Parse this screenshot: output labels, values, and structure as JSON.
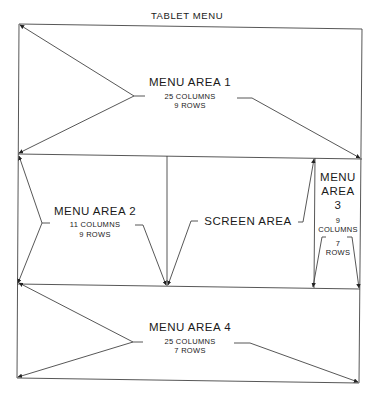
{
  "title": "TABLET MENU",
  "areas": {
    "menu1": {
      "name": "MENU AREA 1",
      "columns": "25 COLUMNS",
      "rows": "9 ROWS"
    },
    "menu2": {
      "name": "MENU AREA 2",
      "columns": "11 COLUMNS",
      "rows": "9 ROWS"
    },
    "screen": {
      "name": "SCREEN AREA"
    },
    "menu3": {
      "name_line1": "MENU",
      "name_line2": "AREA",
      "name_line3": "3",
      "columns_num": "9",
      "columns": "COLUMNS",
      "rows_num": "7",
      "rows": "ROWS"
    },
    "menu4": {
      "name": "MENU AREA 4",
      "columns": "25 COLUMNS",
      "rows": "7 ROWS"
    }
  },
  "colors": {
    "line": "#333333",
    "background": "#ffffff"
  }
}
